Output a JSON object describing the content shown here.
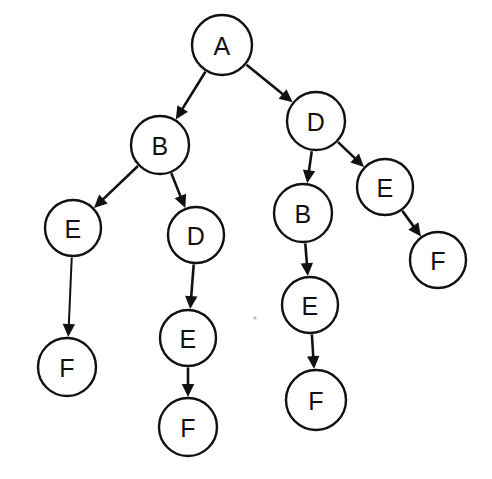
{
  "diagram": {
    "type": "tree",
    "background_color": "#ffffff",
    "stroke_color": "#111111",
    "node_fill_color": "#ffffff",
    "node_radius": 28,
    "nodes": [
      {
        "id": "n0",
        "label": "A",
        "x": 222,
        "y": 45,
        "r": 30
      },
      {
        "id": "n1",
        "label": "B",
        "x": 160,
        "y": 145,
        "r": 29
      },
      {
        "id": "n2",
        "label": "D",
        "x": 316,
        "y": 121,
        "r": 29
      },
      {
        "id": "n3",
        "label": "E",
        "x": 73,
        "y": 228,
        "r": 28
      },
      {
        "id": "n4",
        "label": "D",
        "x": 196,
        "y": 235,
        "r": 28
      },
      {
        "id": "n5",
        "label": "B",
        "x": 303,
        "y": 213,
        "r": 29
      },
      {
        "id": "n6",
        "label": "E",
        "x": 385,
        "y": 187,
        "r": 28
      },
      {
        "id": "n7",
        "label": "F",
        "x": 67,
        "y": 367,
        "r": 29
      },
      {
        "id": "n8",
        "label": "E",
        "x": 188,
        "y": 338,
        "r": 28
      },
      {
        "id": "n9",
        "label": "E",
        "x": 310,
        "y": 305,
        "r": 28
      },
      {
        "id": "n10",
        "label": "F",
        "x": 438,
        "y": 260,
        "r": 28
      },
      {
        "id": "n11",
        "label": "F",
        "x": 188,
        "y": 427,
        "r": 29
      },
      {
        "id": "n12",
        "label": "F",
        "x": 316,
        "y": 400,
        "r": 30
      }
    ],
    "edges": [
      {
        "id": "e0",
        "from": "n0",
        "to": "n1",
        "from_label": "A",
        "to_label": "B",
        "arrow": true
      },
      {
        "id": "e1",
        "from": "n0",
        "to": "n2",
        "from_label": "A",
        "to_label": "D",
        "arrow": true
      },
      {
        "id": "e2",
        "from": "n1",
        "to": "n3",
        "from_label": "B",
        "to_label": "E",
        "arrow": true
      },
      {
        "id": "e3",
        "from": "n1",
        "to": "n4",
        "from_label": "B",
        "to_label": "D",
        "arrow": true
      },
      {
        "id": "e4",
        "from": "n2",
        "to": "n5",
        "from_label": "D",
        "to_label": "B",
        "arrow": true
      },
      {
        "id": "e5",
        "from": "n2",
        "to": "n6",
        "from_label": "D",
        "to_label": "E",
        "arrow": true
      },
      {
        "id": "e6",
        "from": "n3",
        "to": "n7",
        "from_label": "E",
        "to_label": "F",
        "arrow": true
      },
      {
        "id": "e7",
        "from": "n4",
        "to": "n8",
        "from_label": "D",
        "to_label": "E",
        "arrow": true
      },
      {
        "id": "e8",
        "from": "n5",
        "to": "n9",
        "from_label": "B",
        "to_label": "E",
        "arrow": true
      },
      {
        "id": "e9",
        "from": "n6",
        "to": "n10",
        "from_label": "E",
        "to_label": "F",
        "arrow": true
      },
      {
        "id": "e10",
        "from": "n8",
        "to": "n11",
        "from_label": "E",
        "to_label": "F",
        "arrow": true
      },
      {
        "id": "e11",
        "from": "n9",
        "to": "n12",
        "from_label": "E",
        "to_label": "F",
        "arrow": true
      }
    ],
    "specks": [
      {
        "x": 255,
        "y": 318,
        "r": 1.6
      }
    ]
  }
}
